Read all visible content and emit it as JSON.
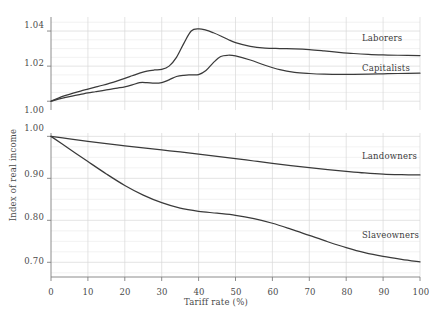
{
  "chart_data": {
    "type": "line",
    "title": "",
    "subtitle": "",
    "xlabel": "Tariff rate (%)",
    "ylabel": "Index of real income",
    "grid": true,
    "legend_position": "inline-right",
    "panels": [
      {
        "name": "upper-panel",
        "ylim": [
          0.995,
          1.048
        ],
        "yticks": [
          1.0,
          1.02,
          1.04
        ],
        "ytick_labels": [
          "1.00",
          "1.02",
          "1.04"
        ],
        "xlim": [
          0,
          100
        ],
        "series": [
          {
            "name": "Laborers",
            "label": "Laborers",
            "color": "#3a3a3a",
            "x": [
              0,
              2,
              4,
              6,
              8,
              10,
              12,
              14,
              16,
              18,
              20,
              22,
              24,
              26,
              28,
              30,
              32,
              34,
              36,
              38,
              40,
              42,
              44,
              46,
              48,
              50,
              54,
              58,
              62,
              66,
              70,
              74,
              78,
              82,
              86,
              90,
              94,
              100
            ],
            "y": [
              1.0,
              1.0018,
              1.0033,
              1.0046,
              1.0058,
              1.0069,
              1.008,
              1.0091,
              1.0103,
              1.0116,
              1.013,
              1.0145,
              1.016,
              1.0172,
              1.0178,
              1.0181,
              1.02,
              1.025,
              1.033,
              1.04,
              1.0412,
              1.0405,
              1.039,
              1.0372,
              1.0352,
              1.0334,
              1.0313,
              1.0303,
              1.03,
              1.0298,
              1.0294,
              1.0287,
              1.0279,
              1.0272,
              1.0267,
              1.0264,
              1.0262,
              1.026
            ]
          },
          {
            "name": "Capitalists",
            "label": "Capitalists",
            "color": "#3a3a3a",
            "x": [
              0,
              2,
              4,
              6,
              8,
              10,
              12,
              14,
              16,
              18,
              20,
              22,
              24,
              26,
              28,
              30,
              32,
              34,
              36,
              38,
              40,
              42,
              44,
              46,
              48,
              50,
              54,
              58,
              62,
              66,
              70,
              74,
              78,
              82,
              86,
              90,
              94,
              100
            ],
            "y": [
              1.0,
              1.0012,
              1.0022,
              1.0031,
              1.0039,
              1.0047,
              1.0054,
              1.0061,
              1.0068,
              1.0075,
              1.0082,
              1.0093,
              1.0106,
              1.0106,
              1.0103,
              1.0106,
              1.0122,
              1.0141,
              1.0148,
              1.015,
              1.0152,
              1.0175,
              1.022,
              1.0255,
              1.0262,
              1.0258,
              1.0235,
              1.0205,
              1.018,
              1.0165,
              1.0158,
              1.0154,
              1.0153,
              1.0153,
              1.0154,
              1.0156,
              1.0158,
              1.016
            ]
          }
        ]
      },
      {
        "name": "lower-panel",
        "ylim": [
          0.665,
          1.008
        ],
        "yticks": [
          0.7,
          0.8,
          0.9,
          1.0
        ],
        "ytick_labels": [
          "0.70",
          "0.80",
          "0.90",
          "1.00"
        ],
        "xlim": [
          0,
          100
        ],
        "series": [
          {
            "name": "Landowners",
            "label": "Landowners",
            "color": "#3a3a3a",
            "x": [
              0,
              5,
              10,
              15,
              20,
              25,
              30,
              35,
              40,
              45,
              50,
              55,
              60,
              65,
              70,
              75,
              80,
              85,
              90,
              95,
              100
            ],
            "y": [
              1.0,
              0.994,
              0.9883,
              0.9828,
              0.9776,
              0.9725,
              0.9676,
              0.9628,
              0.9578,
              0.9525,
              0.947,
              0.9413,
              0.9357,
              0.9304,
              0.9254,
              0.9208,
              0.9166,
              0.9128,
              0.91,
              0.9087,
              0.908
            ]
          },
          {
            "name": "Slaveowners",
            "label": "Slaveowners",
            "color": "#3a3a3a",
            "x": [
              0,
              5,
              10,
              15,
              20,
              25,
              30,
              35,
              40,
              45,
              50,
              55,
              60,
              65,
              70,
              75,
              80,
              85,
              90,
              95,
              100
            ],
            "y": [
              1.0,
              0.97,
              0.94,
              0.9105,
              0.883,
              0.86,
              0.842,
              0.829,
              0.8215,
              0.817,
              0.812,
              0.804,
              0.793,
              0.779,
              0.764,
              0.749,
              0.735,
              0.723,
              0.714,
              0.707,
              0.701
            ]
          }
        ]
      }
    ],
    "xticks": [
      0,
      10,
      20,
      30,
      40,
      50,
      60,
      70,
      80,
      90,
      100
    ],
    "xtick_labels": [
      "0",
      "10",
      "20",
      "30",
      "40",
      "50",
      "60",
      "70",
      "80",
      "90",
      "100"
    ]
  },
  "axes": {
    "y_axis_title": "Index of real income",
    "x_axis_title": "Tariff rate (%)"
  },
  "labels": {
    "laborers": "Laborers",
    "capitalists": "Capitalists",
    "landowners": "Landowners",
    "slaveowners": "Slaveowners"
  },
  "yticks_upper": [
    "1.04",
    "1.02",
    "1.00"
  ],
  "yticks_lower": [
    "1.00",
    "0.90",
    "0.80",
    "0.70"
  ],
  "xticks": [
    "0",
    "10",
    "20",
    "30",
    "40",
    "50",
    "60",
    "70",
    "80",
    "90",
    "100"
  ],
  "colors": {
    "line": "#3a3a3a",
    "grid": "#d8d8d8",
    "axis": "#808080",
    "text": "#4a4a4a"
  }
}
